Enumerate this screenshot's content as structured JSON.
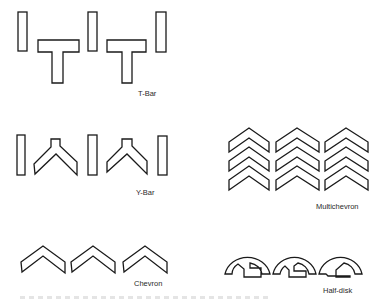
{
  "figure": {
    "groups": [
      {
        "id": "t-bar",
        "label": "T-Bar",
        "elements": [
          "bar",
          "t-shape",
          "bar",
          "t-shape",
          "bar"
        ]
      },
      {
        "id": "y-bar",
        "label": "Y-Bar",
        "elements": [
          "bar",
          "y-shape",
          "bar",
          "y-shape",
          "bar"
        ]
      },
      {
        "id": "multichevron",
        "label": "Multichevron",
        "columns": 3,
        "rows": 3
      },
      {
        "id": "chevron",
        "label": "Chevron",
        "count": 3
      },
      {
        "id": "half-disk",
        "label": "Half-disk",
        "count": 3
      }
    ],
    "colors": {
      "stroke": "#1a1a1a",
      "fill": "#ffffff",
      "text": "#2a2a2a"
    }
  }
}
